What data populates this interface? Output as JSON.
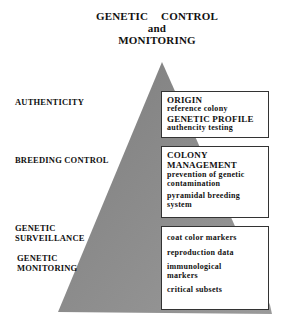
{
  "title": {
    "line1": "GENETIC CONTROL",
    "line2": "and",
    "line3": "MONITORING"
  },
  "colors": {
    "pyramid_fill": "#8c8c8c",
    "box_border": "#333333",
    "text": "#111111"
  },
  "side_labels": {
    "authenticity": "AUTHENTICITY",
    "breeding_control": "BREEDING CONTROL",
    "genetic_surveillance_1": "GENETIC",
    "genetic_surveillance_2": "SURVEILLANCE",
    "genetic_monitoring_1": "GENETIC",
    "genetic_monitoring_2": "MONITORING"
  },
  "boxes": {
    "origin": {
      "heading": "ORIGIN",
      "line1": "reference colony",
      "heading2": "GENETIC PROFILE",
      "line2": "authencity testing"
    },
    "colony": {
      "heading1": "COLONY",
      "heading2": "MANAGEMENT",
      "line1": "prevention of genetic",
      "line2": "contamination",
      "line3": "pyramidal breeding",
      "line4": "system"
    },
    "monitoring": {
      "items": [
        "coat color markers",
        "reproduction data",
        "immunological",
        "markers",
        "critical subsets"
      ]
    }
  }
}
